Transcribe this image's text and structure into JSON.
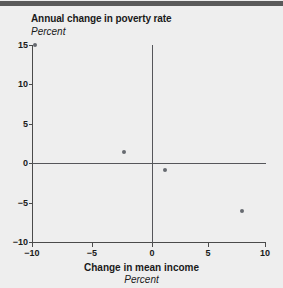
{
  "chart_data": {
    "type": "scatter",
    "title": "Annual change in poverty rate",
    "ylabel": "Percent",
    "xlabel": "Change in mean income",
    "x_unit": "Percent",
    "xlim": [
      -10,
      10
    ],
    "ylim": [
      -10,
      15
    ],
    "x_ticks": [
      -10,
      -5,
      0,
      5,
      10
    ],
    "x_tick_labels": [
      "−10",
      "−5",
      "0",
      "5",
      "10"
    ],
    "y_ticks": [
      15,
      10,
      5,
      0,
      -5,
      -10
    ],
    "y_tick_labels": [
      "15",
      "10",
      "5",
      "0",
      "−5",
      "−10"
    ],
    "grid": false,
    "legend": "none",
    "zero_lines": true,
    "marker_color": "#666a70",
    "axis_color": "#4a4a4a",
    "background_color": "#eeeeee",
    "points": [
      {
        "x": -9.7,
        "y": 15.0
      },
      {
        "x": -2.1,
        "y": 1.4
      },
      {
        "x": 1.4,
        "y": -0.9
      },
      {
        "x": 8.0,
        "y": -6.1
      }
    ]
  }
}
